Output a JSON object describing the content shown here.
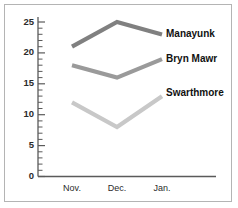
{
  "figure": {
    "border_color": "#b4b4b4",
    "background": "#ffffff"
  },
  "chart_data": {
    "type": "line",
    "title": "",
    "subtitle": "",
    "xlabel": "",
    "ylabel": "",
    "categories": [
      "Nov.",
      "Dec.",
      "Jan."
    ],
    "ylim": [
      0,
      25
    ],
    "xlim": [
      0,
      3
    ],
    "grid": false,
    "legend_position": "right-inline-labels",
    "y_ticks_major": [
      0,
      5,
      10,
      15,
      20,
      25
    ],
    "y_tick_labels": [
      "0",
      "5",
      "10",
      "15",
      "20",
      "25"
    ],
    "y_minor_step": 1,
    "series": [
      {
        "name": "Manayunk",
        "values": [
          21,
          25,
          23
        ],
        "color": "#808080"
      },
      {
        "name": "Bryn Mawr",
        "values": [
          18,
          16,
          19
        ],
        "color": "#9a9a9a"
      },
      {
        "name": "Swarthmore",
        "values": [
          12,
          8,
          13
        ],
        "color": "#c8c8c8"
      }
    ]
  },
  "axis": {
    "y_label_0": "0",
    "y_label_5": "5",
    "y_label_10": "10",
    "y_label_15": "15",
    "y_label_20": "20",
    "y_label_25": "25",
    "x_label_nov": "Nov.",
    "x_label_dec": "Dec.",
    "x_label_jan": "Jan."
  },
  "labels": {
    "series_0": "Manayunk",
    "series_1": "Bryn Mawr",
    "series_2": "Swarthmore"
  }
}
